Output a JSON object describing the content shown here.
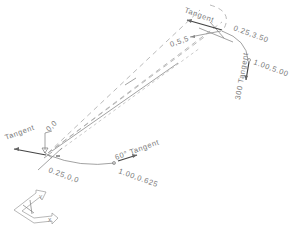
{
  "diagram": {
    "type": "CAD isometric path curve with tangent handles",
    "start_point": {
      "label_position": "0,0",
      "label_coords": "0.25,0,0",
      "tangent_label": "Tangent"
    },
    "mid_point": {
      "label_angle_tangent": "60° Tangent",
      "label_coords": "1.00,0.625"
    },
    "end_point": {
      "tangent_label": "Tangent",
      "label_coords": "0.25,3.50",
      "label_down_tangent": "300 Tangent",
      "label_down_coords": "1.00,5.00"
    },
    "axis_label": "0,5,5",
    "ucs_icon": {
      "x_label": "X",
      "y_label": "Y"
    }
  }
}
